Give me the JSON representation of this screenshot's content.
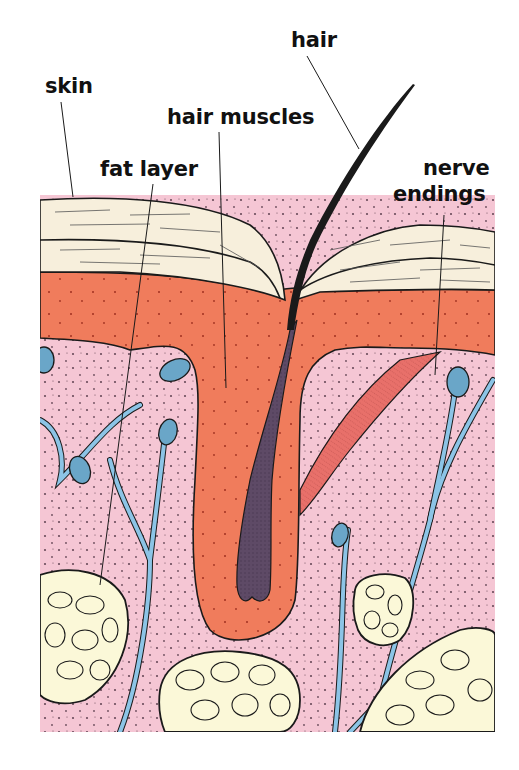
{
  "labels": {
    "hair": "hair",
    "skin": "skin",
    "hair_muscles": "hair muscles",
    "fat_layer": "fat layer",
    "nerve_endings_line1": "nerve",
    "nerve_endings_line2": "endings"
  },
  "colors": {
    "epidermis": "#f7efdc",
    "dermis_red": "#f07c5c",
    "tissue_pink": "#f5c6d4",
    "hair_shaft": "#5e4a66",
    "nerve_blue": "#8cc4e6",
    "fat_cells": "#fbf8d8",
    "muscle": "#e8706a",
    "outline": "#1a1a1a"
  }
}
